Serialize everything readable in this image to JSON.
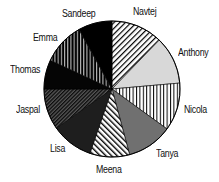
{
  "chart_data": {
    "type": "pie",
    "title": "",
    "start_angle_deg": 0,
    "direction": "clockwise",
    "legend": "none (direct labels around pie)",
    "categories": [
      "Navtej",
      "Anthony",
      "Nicola",
      "Tanya",
      "Meena",
      "Lisa",
      "Jaspal",
      "Thomas",
      "Emma",
      "Sandeep"
    ],
    "values_deg": [
      44,
      41,
      41,
      39,
      34,
      36,
      35,
      25,
      36,
      29
    ],
    "values_pct": [
      12.2,
      11.4,
      11.4,
      10.8,
      9.4,
      10.0,
      9.7,
      6.9,
      10.0,
      8.1
    ],
    "fills": [
      {
        "pattern": "diagonal-hatch",
        "color": "#000000",
        "bg": "#ffffff"
      },
      {
        "pattern": "solid",
        "color": "#d8d8d8"
      },
      {
        "pattern": "vertical-lines",
        "color": "#000000",
        "bg": "#ffffff"
      },
      {
        "pattern": "solid",
        "color": "#707070"
      },
      {
        "pattern": "diagonal-hatch-reverse",
        "color": "#000000",
        "bg": "#ffffff"
      },
      {
        "pattern": "solid",
        "color": "#1e1e1e"
      },
      {
        "pattern": "dense-diagonal",
        "color": "#0a0a0a",
        "bg": "#555555"
      },
      {
        "pattern": "solid",
        "color": "#050505"
      },
      {
        "pattern": "vertical-lines-dark",
        "color": "#000000",
        "bg": "#bdbdbd"
      },
      {
        "pattern": "solid",
        "color": "#000000"
      }
    ]
  },
  "labels": {
    "navtej": "Navtej",
    "anthony": "Anthony",
    "nicola": "Nicola",
    "tanya": "Tanya",
    "meena": "Meena",
    "lisa": "Lisa",
    "jaspal": "Jaspal",
    "thomas": "Thomas",
    "emma": "Emma",
    "sandeep": "Sandeep"
  }
}
